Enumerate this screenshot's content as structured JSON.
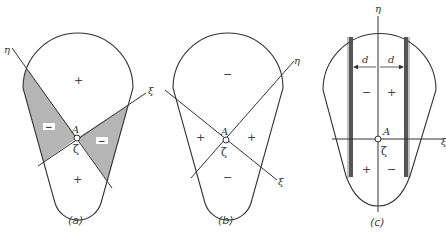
{
  "figure": {
    "panels": [
      {
        "id": "a",
        "caption": "(a)",
        "point_label": "A",
        "center_label": "ζ",
        "axis_eta": "η",
        "axis_xi": "ξ",
        "regions": [
          {
            "position": "top",
            "sign": "+"
          },
          {
            "position": "bottom",
            "sign": "+"
          },
          {
            "position": "left",
            "sign": "−",
            "shaded": true
          },
          {
            "position": "right",
            "sign": "−",
            "shaded": true
          }
        ]
      },
      {
        "id": "b",
        "caption": "(b)",
        "point_label": "A",
        "center_label": "ζ",
        "axis_eta": "η",
        "axis_xi": "ξ",
        "regions": [
          {
            "position": "top",
            "sign": "−"
          },
          {
            "position": "bottom",
            "sign": "−"
          },
          {
            "position": "left",
            "sign": "+"
          },
          {
            "position": "right",
            "sign": "+"
          }
        ]
      },
      {
        "id": "c",
        "caption": "(c)",
        "point_label": "A",
        "center_label": "ζ",
        "axis_eta": "η",
        "axis_xi": "ξ",
        "dimension_left": "d",
        "dimension_right": "d",
        "regions": [
          {
            "position": "upper-left",
            "sign": "−"
          },
          {
            "position": "upper-right",
            "sign": "+"
          },
          {
            "position": "lower-left",
            "sign": "+"
          },
          {
            "position": "lower-right",
            "sign": "−"
          }
        ]
      }
    ],
    "colors": {
      "outline": "#333333",
      "shading": "#b5b5b5",
      "background": "#ffffff"
    }
  }
}
